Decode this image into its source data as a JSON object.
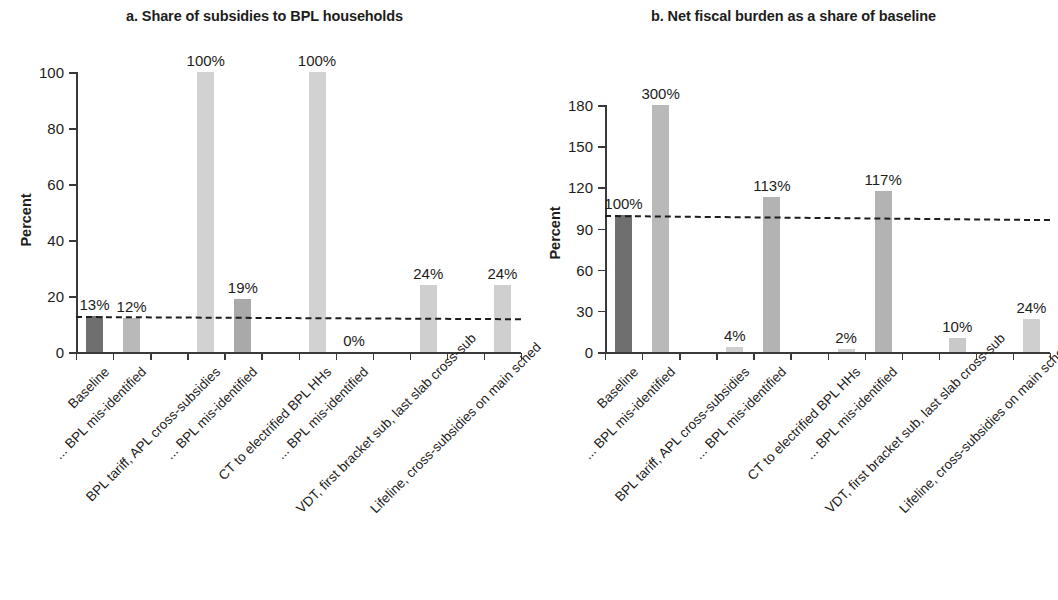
{
  "figure": {
    "ylabel": "Percent",
    "panels": [
      {
        "title": "a. Share of subsidies to BPL households",
        "ylabel": "Percent",
        "yticks": [
          "0",
          "20",
          "40",
          "60",
          "80",
          "100"
        ]
      },
      {
        "title": "b. Net fiscal burden as a share of baseline",
        "ylabel": "Percent",
        "yticks": [
          "0",
          "30",
          "60",
          "90",
          "120",
          "150",
          "180"
        ]
      }
    ]
  },
  "categories": [
    "Baseline",
    "... BPL mis-identified",
    "BPL tariff, APL cross-subsidies",
    "... BPL mis-identified",
    "CT to electrified BPL HHs",
    "... BPL mis-identified",
    "VDT, first bracket sub, last slab cross-sub",
    "Lifeline, cross-subsidies on main sched"
  ],
  "chart_data": [
    {
      "type": "bar",
      "title": "a. Share of subsidies to BPL households",
      "xlabel": "",
      "ylabel": "Percent",
      "ylim": [
        0,
        100
      ],
      "yticks": [
        0,
        20,
        40,
        60,
        80,
        100
      ],
      "grid": false,
      "legend": "none",
      "categories": [
        "Baseline",
        "... BPL mis-identified",
        "BPL tariff, APL cross-subsidies",
        "... BPL mis-identified",
        "CT to electrified BPL HHs",
        "... BPL mis-identified",
        "VDT, first bracket sub, last slab cross-sub",
        "Lifeline, cross-subsidies on main sched"
      ],
      "values": [
        13,
        12,
        100,
        19,
        100,
        0,
        24,
        24
      ],
      "labels": [
        "13%",
        "12%",
        "100%",
        "19%",
        "100%",
        "0%",
        "24%",
        "24%"
      ],
      "bar_colors": [
        "#6f6f6f",
        "#b9b9b9",
        "#d2d2d2",
        "#a9a9a9",
        "#d2d2d2",
        "#d2d2d2",
        "#cfcfcf",
        "#cfcfcf"
      ],
      "annotations": [
        {
          "type": "reference-line",
          "style": "dashed",
          "label": "baseline",
          "y_start": 13,
          "y_end": 12
        }
      ]
    },
    {
      "type": "bar",
      "title": "b. Net fiscal burden as a share of baseline",
      "xlabel": "",
      "ylabel": "Percent",
      "ylim": [
        0,
        180
      ],
      "yticks": [
        0,
        30,
        60,
        90,
        120,
        150,
        180
      ],
      "grid": false,
      "legend": "none",
      "categories": [
        "Baseline",
        "... BPL mis-identified",
        "BPL tariff, APL cross-subsidies",
        "... BPL mis-identified",
        "CT to electrified BPL HHs",
        "... BPL mis-identified",
        "VDT, first bracket sub, last slab cross-sub",
        "Lifeline, cross-subsidies on main sched"
      ],
      "values": [
        100,
        300,
        4,
        113,
        2,
        117,
        10,
        24
      ],
      "plotted_values": [
        100,
        180,
        4,
        113,
        2,
        117,
        10,
        24
      ],
      "labels": [
        "100%",
        "300%",
        "4%",
        "113%",
        "2%",
        "117%",
        "10%",
        "24%"
      ],
      "bar_colors": [
        "#6f6f6f",
        "#b9b9b9",
        "#cfcfcf",
        "#b3b3b3",
        "#cfcfcf",
        "#b3b3b3",
        "#c9c9c9",
        "#cfcfcf"
      ],
      "annotations": [
        {
          "type": "reference-line",
          "style": "dashed",
          "label": "baseline",
          "y_start": 100,
          "y_end": 97
        }
      ]
    }
  ],
  "colors": {
    "baseline_bar": "#6f6f6f",
    "light_bar": "#cfcfcf",
    "mid_bar": "#b3b3b3",
    "axis": "#3a3a3a",
    "text": "#1d1d1b",
    "background": "#ffffff"
  }
}
